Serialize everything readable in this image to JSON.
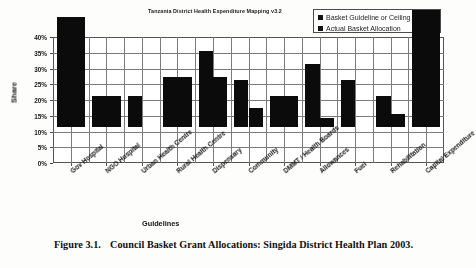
{
  "figure": {
    "caption_number": "Figure 3.1.",
    "caption_text": "Council Basket Grant Allocations: Singida District Health Plan 2003."
  },
  "chart_data": {
    "type": "bar",
    "title": "Tanzania District Health Expenditure Mapping v3.2",
    "xlabel": "Guidelines",
    "ylabel": "Share",
    "ylim": [
      0,
      40
    ],
    "ytick_labels": [
      "0%",
      "5%",
      "10%",
      "15%",
      "20%",
      "25%",
      "30%",
      "35%",
      "40%"
    ],
    "ytick_values": [
      0,
      5,
      10,
      15,
      20,
      25,
      30,
      35,
      40
    ],
    "grid": true,
    "legend_position": "top-right",
    "categories": [
      "Gov Hospital",
      "NGO Hospital",
      "Urban Health Centre",
      "Rural Health Centre",
      "Dispensary",
      "Community",
      "DMMT / Health Boards",
      "Allowances",
      "Fuel",
      "Rehabilitation",
      "Capital Expenditure"
    ],
    "series": [
      {
        "name": "Basket Guideline or Ceiling",
        "color": "#0b0b0b",
        "values": [
          35,
          10,
          10,
          16,
          24,
          15,
          10,
          20,
          15,
          10,
          37
        ]
      },
      {
        "name": "Actual Basket Allocation",
        "color": "#0b0b0b",
        "values": [
          35,
          10,
          0,
          16,
          16,
          6,
          10,
          3,
          0,
          4,
          37
        ]
      }
    ]
  }
}
